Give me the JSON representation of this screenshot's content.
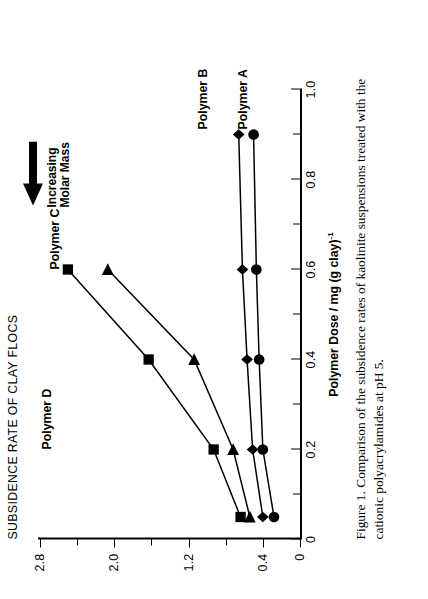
{
  "figure": {
    "caption": "Figure 1.  Comparison of the subsidence rates of kaolinite suspensions treated with the cationic polyacrylamides at pH 5."
  },
  "annotations": {
    "arrow_label_line1": "Increasing",
    "arrow_label_line2": "Molar Mass",
    "polymer_a": "Polymer A",
    "polymer_b": "Polymer B",
    "polymer_c": "Polymer C",
    "polymer_d": "Polymer D"
  },
  "chart_data": {
    "type": "line",
    "title": "SUBSIDENCE RATE OF CLAY FLOCS",
    "xlabel": "Polymer Dose / mg (g clay)",
    "xlabel_exponent": "-1",
    "ylabel": "",
    "xlim": [
      0,
      1.0
    ],
    "ylim": [
      0,
      2.8
    ],
    "xticks": [
      0,
      0.2,
      0.4,
      0.6,
      0.8,
      1.0
    ],
    "xticklabels": [
      "0",
      "0.2",
      "0.4",
      "0.6",
      "0.8",
      "1.0"
    ],
    "xminorticks": [
      0.1,
      0.3,
      0.5,
      0.7,
      0.9
    ],
    "yticks": [
      0,
      0.4,
      1.2,
      2.0,
      2.8
    ],
    "yticklabels": [
      "0",
      "0.4",
      "1.2",
      "2.0",
      "2.8"
    ],
    "yminorticks": [
      0.8,
      1.6,
      2.4
    ],
    "grid": false,
    "legend": "inline-annotations",
    "series": [
      {
        "name": "Polymer A",
        "marker": "circle",
        "x": [
          0.05,
          0.2,
          0.4,
          0.6,
          0.9
        ],
        "y": [
          0.28,
          0.4,
          0.44,
          0.47,
          0.5
        ]
      },
      {
        "name": "Polymer B",
        "marker": "diamond",
        "x": [
          0.05,
          0.2,
          0.4,
          0.6,
          0.9
        ],
        "y": [
          0.4,
          0.51,
          0.57,
          0.62,
          0.66
        ]
      },
      {
        "name": "Polymer C",
        "marker": "triangle",
        "x": [
          0.05,
          0.2,
          0.4,
          0.6
        ],
        "y": [
          0.54,
          0.72,
          1.14,
          2.07
        ]
      },
      {
        "name": "Polymer D",
        "marker": "square",
        "x": [
          0.05,
          0.2,
          0.4,
          0.6
        ],
        "y": [
          0.64,
          0.93,
          1.63,
          2.5
        ]
      }
    ]
  }
}
